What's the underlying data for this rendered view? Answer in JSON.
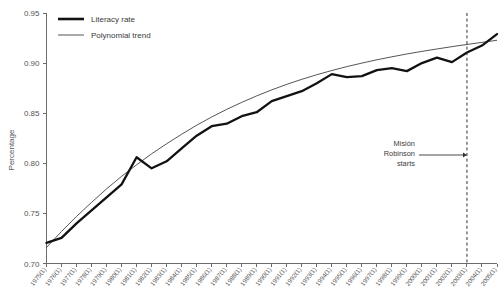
{
  "chart_data": {
    "type": "line",
    "title": "",
    "subtitle": "",
    "xlabel": "",
    "ylabel": "Percentage",
    "ylim": [
      0.7,
      0.95
    ],
    "ytick_labels": [
      "0.95",
      "0.90",
      "0.85",
      "0.80",
      "0.75",
      "0.70"
    ],
    "ytick_values": [
      0.95,
      0.9,
      0.85,
      0.8,
      0.75,
      0.7
    ],
    "grid": false,
    "legend_position": "top-left",
    "categories": [
      "1975(1)",
      "1976(1)",
      "1977(1)",
      "1978(1)",
      "1979(1)",
      "1980(1)",
      "1981(1)",
      "1982(1)",
      "1983(1)",
      "1984(1)",
      "1985(1)",
      "1986(1)",
      "1987(1)",
      "1988(1)",
      "1989(1)",
      "1990(1)",
      "1991(1)",
      "1992(1)",
      "1993(1)",
      "1994(1)",
      "1995(1)",
      "1996(1)",
      "1997(1)",
      "1998(1)",
      "1999(1)",
      "2000(1)",
      "2001(1)",
      "2002(1)",
      "2003(1)",
      "2004(1)",
      "2005(1)"
    ],
    "series": [
      {
        "name": "Literacy rate",
        "style": "thick-solid",
        "color": "#121212",
        "values": [
          0.7205,
          0.7255,
          0.74,
          0.753,
          0.766,
          0.779,
          0.806,
          0.795,
          0.802,
          0.815,
          0.8275,
          0.837,
          0.8395,
          0.847,
          0.851,
          0.862,
          0.867,
          0.872,
          0.88,
          0.889,
          0.886,
          0.887,
          0.893,
          0.895,
          0.892,
          0.9,
          0.9055,
          0.901,
          0.9105,
          0.9175,
          0.929
        ]
      },
      {
        "name": "Polynomial trend",
        "style": "thin-solid",
        "color": "#2a2a2a",
        "values": [
          0.716,
          0.732,
          0.747,
          0.761,
          0.7745,
          0.787,
          0.7985,
          0.8095,
          0.8195,
          0.829,
          0.838,
          0.8462,
          0.8538,
          0.8608,
          0.8673,
          0.8733,
          0.8788,
          0.8838,
          0.8884,
          0.8926,
          0.8965,
          0.9,
          0.9033,
          0.9063,
          0.9091,
          0.9117,
          0.9141,
          0.9164,
          0.9186,
          0.9207,
          0.9228
        ]
      }
    ],
    "annotations": [
      {
        "text_lines": [
          "Misión",
          "Robinson",
          "starts"
        ],
        "target_category": "2003(1)",
        "marker": "dashed-vertical-line",
        "arrow": "right"
      }
    ]
  },
  "legend": {
    "items": [
      {
        "label": "Literacy rate"
      },
      {
        "label": "Polynomial trend"
      }
    ]
  },
  "colors": {
    "series_main": "#121212",
    "series_trend": "#2a2a2a",
    "axis": "#6b6b6b",
    "text": "#555555",
    "background": "#ffffff"
  }
}
